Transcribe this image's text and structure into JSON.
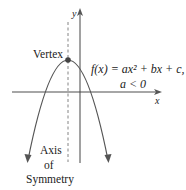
{
  "diagram": {
    "type": "parabola-graph",
    "axes": {
      "x_label": "x",
      "y_label": "y"
    },
    "labels": {
      "vertex": "Vertex",
      "equation": "f(x) = ax² + bx + c,",
      "condition": "a < 0",
      "axis_line1": "Axis",
      "axis_line2": "of",
      "axis_line3": "Symmetry"
    },
    "colors": {
      "curve": "#555555",
      "axis": "#444444",
      "xaxis": "#777777",
      "text": "#222222"
    }
  }
}
